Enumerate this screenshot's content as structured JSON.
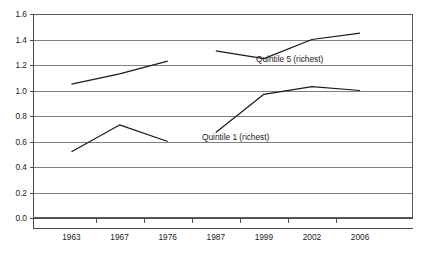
{
  "chart_data": {
    "type": "line",
    "title": "",
    "xlabel": "",
    "ylabel": "",
    "categories": [
      "1963",
      "1967",
      "1976",
      "1987",
      "1999",
      "2002",
      "2006"
    ],
    "ylim": [
      0.0,
      1.6
    ],
    "xlim": [
      0,
      8
    ],
    "grid": true,
    "grid_axis": "y",
    "legend": "inline-annotation",
    "y_ticks": [
      "0.0",
      "0.2",
      "0.4",
      "0.6",
      "0.8",
      "1.0",
      "1.2",
      "1.4",
      "1.6"
    ],
    "y_tick_values": [
      0.0,
      0.2,
      0.4,
      0.6,
      0.8,
      1.0,
      1.2,
      1.4,
      1.6
    ],
    "series": [
      {
        "name": "Quintile 5 (richest)",
        "color": "#1a1a1a",
        "broken_between": [
          "1976",
          "1987"
        ],
        "segments": [
          {
            "x": [
              "1963",
              "1967",
              "1976"
            ],
            "values": [
              1.05,
              1.13,
              1.23
            ]
          },
          {
            "x": [
              "1987",
              "1999",
              "2002",
              "2006"
            ],
            "values": [
              1.31,
              1.25,
              1.4,
              1.45
            ]
          }
        ],
        "values": [
          1.05,
          1.13,
          1.23,
          1.31,
          1.4,
          1.42,
          1.45
        ]
      },
      {
        "name": "Quintile 1 (richest)",
        "color": "#1a1a1a",
        "broken_between": [
          "1976",
          "1987"
        ],
        "segments": [
          {
            "x": [
              "1963",
              "1967",
              "1976"
            ],
            "values": [
              0.52,
              0.73,
              0.6
            ]
          },
          {
            "x": [
              "1987",
              "1999",
              "2002",
              "2006"
            ],
            "values": [
              0.67,
              0.97,
              1.03,
              1.0
            ]
          }
        ],
        "values": [
          0.52,
          0.73,
          0.6,
          0.67,
          0.97,
          1.03,
          1.0
        ]
      }
    ],
    "annotations": [
      {
        "text": "Quintile 5 (richest)",
        "x_pixel": 256,
        "y_pixel": 62
      },
      {
        "text": "Quintile 1 (richest)",
        "x_pixel": 202,
        "y_pixel": 140
      }
    ]
  },
  "axes": {
    "y_tick_labels": [
      "1.6",
      "1.4",
      "1.2",
      "1.0",
      "0.8",
      "0.6",
      "0.4",
      "0.2",
      "0.0"
    ],
    "x_tick_labels": [
      "1963",
      "1967",
      "1976",
      "1987",
      "1999",
      "2002",
      "2006"
    ]
  }
}
